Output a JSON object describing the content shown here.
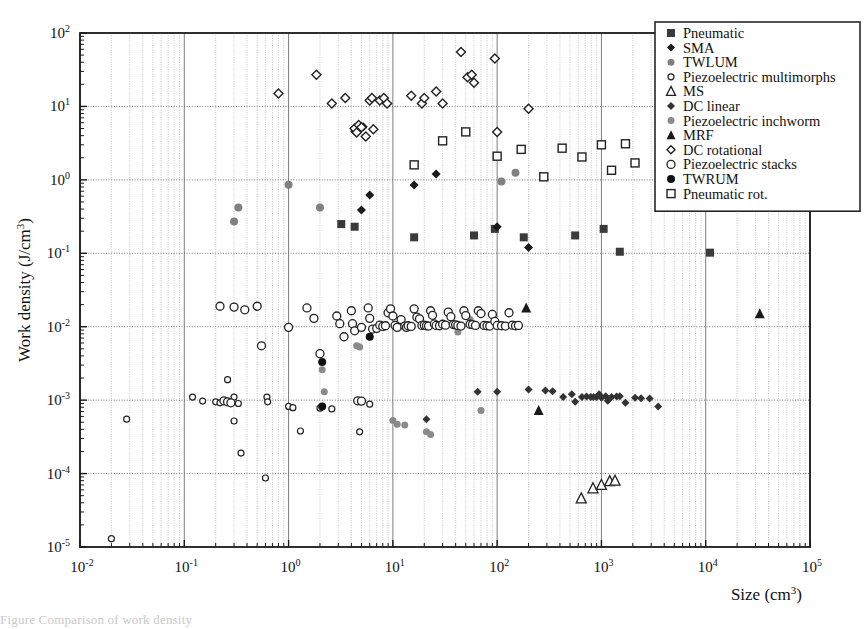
{
  "chart_data": {
    "type": "scatter",
    "title": "",
    "xlabel": "Size (cm3)",
    "xlabel_base": "Size (cm",
    "xlabel_exp": "3",
    "xlabel_close": ")",
    "ylabel": "Work density (J/cm3)",
    "ylabel_base": "Work density (J/cm",
    "ylabel_exp": "3",
    "ylabel_close": ")",
    "xscale": "log",
    "yscale": "log",
    "xlim": [
      0.01,
      100000
    ],
    "ylim": [
      1e-05,
      100
    ],
    "grid": true,
    "grid_minor": true,
    "legend_position": "top-right",
    "x_ticks": [
      {
        "value": 0.01,
        "label": "10",
        "exp": "-2"
      },
      {
        "value": 0.1,
        "label": "10",
        "exp": "-1"
      },
      {
        "value": 1,
        "label": "10",
        "exp": "0"
      },
      {
        "value": 10,
        "label": "10",
        "exp": "1"
      },
      {
        "value": 100,
        "label": "10",
        "exp": "2"
      },
      {
        "value": 1000,
        "label": "10",
        "exp": "3"
      },
      {
        "value": 10000,
        "label": "10",
        "exp": "4"
      },
      {
        "value": 100000,
        "label": "10",
        "exp": "5"
      }
    ],
    "y_ticks": [
      {
        "value": 1e-05,
        "label": "10",
        "exp": "-5"
      },
      {
        "value": 0.0001,
        "label": "10",
        "exp": "-4"
      },
      {
        "value": 0.001,
        "label": "10",
        "exp": "-3"
      },
      {
        "value": 0.01,
        "label": "10",
        "exp": "-2"
      },
      {
        "value": 0.1,
        "label": "10",
        "exp": "-1"
      },
      {
        "value": 1,
        "label": "10",
        "exp": "0"
      },
      {
        "value": 10,
        "label": "10",
        "exp": "1"
      },
      {
        "value": 100,
        "label": "10",
        "exp": "2"
      }
    ],
    "series": [
      {
        "name": "Pneumatic",
        "marker": "filled-square",
        "color": "#3a3a3a",
        "size": 8,
        "points": [
          [
            3.2,
            0.25
          ],
          [
            4.3,
            0.23
          ],
          [
            16,
            0.165
          ],
          [
            60,
            0.175
          ],
          [
            95,
            0.215
          ],
          [
            180,
            0.165
          ],
          [
            560,
            0.175
          ],
          [
            1050,
            0.215
          ],
          [
            1500,
            0.105
          ],
          [
            11000,
            0.102
          ]
        ]
      },
      {
        "name": "SMA",
        "marker": "filled-diamond",
        "color": "#1a1a1a",
        "size": 9,
        "points": [
          [
            4.3,
            4.6
          ],
          [
            5.2,
            5.3
          ],
          [
            6.0,
            0.62
          ],
          [
            5.0,
            0.39
          ],
          [
            16,
            0.85
          ],
          [
            26,
            1.2
          ],
          [
            100,
            0.23
          ],
          [
            200,
            0.12
          ]
        ]
      },
      {
        "name": "TWLUM",
        "marker": "filled-circle-gray",
        "color": "#808080",
        "size": 8,
        "points": [
          [
            0.3,
            0.27
          ],
          [
            0.33,
            0.42
          ],
          [
            1.0,
            0.86
          ],
          [
            2.0,
            0.42
          ],
          [
            110,
            0.95
          ],
          [
            150,
            1.25
          ]
        ]
      },
      {
        "name": "Piezoelectric multimorphs",
        "marker": "open-circle-small",
        "color": "#222222",
        "size": 6,
        "points": [
          [
            0.02,
            1.3e-05
          ],
          [
            0.028,
            0.00055
          ],
          [
            0.12,
            0.0011
          ],
          [
            0.15,
            0.00097
          ],
          [
            0.2,
            0.00095
          ],
          [
            0.22,
            0.00092
          ],
          [
            0.26,
            0.0019
          ],
          [
            0.3,
            0.00052
          ],
          [
            0.3,
            0.0011
          ],
          [
            0.33,
            0.0009
          ],
          [
            0.35,
            0.00019
          ],
          [
            0.62,
            0.0011
          ],
          [
            0.63,
            0.00095
          ],
          [
            0.6,
            8.7e-05
          ],
          [
            1.0,
            0.00082
          ],
          [
            1.1,
            0.00079
          ],
          [
            1.3,
            0.00038
          ],
          [
            2.0,
            0.00078
          ],
          [
            2.6,
            0.00076
          ],
          [
            4.8,
            0.00037
          ],
          [
            6.0,
            0.00088
          ]
        ]
      },
      {
        "name": "MS",
        "marker": "open-triangle",
        "color": "#222222",
        "size": 9,
        "points": [
          [
            640,
            4.6e-05
          ],
          [
            830,
            6.3e-05
          ],
          [
            1000,
            7e-05
          ],
          [
            1200,
            7.9e-05
          ],
          [
            1350,
            8e-05
          ]
        ]
      },
      {
        "name": "DC linear",
        "marker": "filled-diamond",
        "color": "#333333",
        "size": 8,
        "points": [
          [
            21,
            0.00055
          ],
          [
            65,
            0.0013
          ],
          [
            100,
            0.0013
          ],
          [
            200,
            0.0014
          ],
          [
            290,
            0.00135
          ],
          [
            340,
            0.00132
          ],
          [
            430,
            0.0011
          ],
          [
            520,
            0.0012
          ],
          [
            560,
            0.00095
          ],
          [
            650,
            0.0011
          ],
          [
            720,
            0.00112
          ],
          [
            790,
            0.0011
          ],
          [
            840,
            0.0011
          ],
          [
            900,
            0.0011
          ],
          [
            950,
            0.0012
          ],
          [
            1000,
            0.00108
          ],
          [
            1100,
            0.00113
          ],
          [
            1150,
            0.00098
          ],
          [
            1250,
            0.0011
          ],
          [
            1400,
            0.00112
          ],
          [
            1500,
            0.00113
          ],
          [
            1700,
            0.00092
          ],
          [
            2100,
            0.00108
          ],
          [
            2400,
            0.00106
          ],
          [
            2900,
            0.00105
          ],
          [
            3500,
            0.00082
          ]
        ]
      },
      {
        "name": "Piezoelectric inchworm",
        "marker": "filled-circle-gray",
        "color": "#8a8a8a",
        "size": 7,
        "points": [
          [
            2.1,
            0.0026
          ],
          [
            2.2,
            0.0013
          ],
          [
            4.5,
            0.0055
          ],
          [
            4.8,
            0.0053
          ],
          [
            10,
            0.00053
          ],
          [
            11,
            0.00047
          ],
          [
            13,
            0.00046
          ],
          [
            21,
            0.00037
          ],
          [
            23,
            0.00034
          ],
          [
            42,
            0.0085
          ],
          [
            55,
            0.0125
          ],
          [
            70,
            0.00072
          ]
        ]
      },
      {
        "name": "MRF",
        "marker": "filled-triangle",
        "color": "#1a1a1a",
        "size": 9,
        "points": [
          [
            190,
            0.018
          ],
          [
            250,
            0.00072
          ],
          [
            33000,
            0.015
          ]
        ]
      },
      {
        "name": "DC rotational",
        "marker": "open-diamond",
        "color": "#222222",
        "size": 9,
        "points": [
          [
            0.8,
            15
          ],
          [
            1.85,
            27
          ],
          [
            2.6,
            11
          ],
          [
            3.5,
            13
          ],
          [
            4.3,
            5.0
          ],
          [
            4.5,
            4.4
          ],
          [
            4.7,
            5.6
          ],
          [
            5.0,
            5.2
          ],
          [
            5.5,
            3.9
          ],
          [
            6.0,
            12
          ],
          [
            6.3,
            13
          ],
          [
            6.5,
            4.9
          ],
          [
            7.5,
            12
          ],
          [
            8.2,
            13
          ],
          [
            8.8,
            11
          ],
          [
            15,
            14
          ],
          [
            19,
            11
          ],
          [
            20,
            13
          ],
          [
            26,
            16
          ],
          [
            30,
            11
          ],
          [
            45,
            55
          ],
          [
            52,
            25
          ],
          [
            57,
            27
          ],
          [
            60,
            21
          ],
          [
            95,
            45
          ],
          [
            100,
            4.5
          ],
          [
            200,
            9.3
          ]
        ]
      },
      {
        "name": "Piezoelectric stacks",
        "marker": "open-circle",
        "color": "#222222",
        "size": 8,
        "points": [
          [
            0.22,
            0.019
          ],
          [
            0.3,
            0.0185
          ],
          [
            0.38,
            0.017
          ],
          [
            0.5,
            0.019
          ],
          [
            0.55,
            0.0055
          ],
          [
            1.0,
            0.0098
          ],
          [
            1.5,
            0.018
          ],
          [
            1.75,
            0.013
          ],
          [
            2.0,
            0.0043
          ],
          [
            2.9,
            0.014
          ],
          [
            3.1,
            0.011
          ],
          [
            3.4,
            0.0073
          ],
          [
            4.0,
            0.0165
          ],
          [
            4.1,
            0.011
          ],
          [
            4.3,
            0.0088
          ],
          [
            5.0,
            0.0098
          ],
          [
            5.8,
            0.018
          ],
          [
            6.0,
            0.013
          ],
          [
            6.4,
            0.0093
          ],
          [
            7.0,
            0.0095
          ],
          [
            7.5,
            0.0105
          ],
          [
            8.0,
            0.0101
          ],
          [
            8.5,
            0.0103
          ],
          [
            9.0,
            0.0155
          ],
          [
            9.5,
            0.0175
          ],
          [
            10,
            0.014
          ],
          [
            10.5,
            0.0104
          ],
          [
            11,
            0.0098
          ],
          [
            12,
            0.0125
          ],
          [
            13,
            0.0102
          ],
          [
            13.5,
            0.0098
          ],
          [
            14,
            0.0103
          ],
          [
            15,
            0.0101
          ],
          [
            16,
            0.0175
          ],
          [
            17,
            0.0135
          ],
          [
            18,
            0.0128
          ],
          [
            19,
            0.0104
          ],
          [
            20,
            0.0105
          ],
          [
            21,
            0.0103
          ],
          [
            22,
            0.0102
          ],
          [
            23,
            0.0165
          ],
          [
            24,
            0.0143
          ],
          [
            25,
            0.0109
          ],
          [
            26,
            0.0104
          ],
          [
            28,
            0.0103
          ],
          [
            30,
            0.0108
          ],
          [
            32,
            0.0105
          ],
          [
            34,
            0.0158
          ],
          [
            36,
            0.0137
          ],
          [
            38,
            0.0107
          ],
          [
            40,
            0.0106
          ],
          [
            42,
            0.0104
          ],
          [
            45,
            0.0102
          ],
          [
            48,
            0.0165
          ],
          [
            50,
            0.0142
          ],
          [
            55,
            0.0108
          ],
          [
            58,
            0.0107
          ],
          [
            62,
            0.0104
          ],
          [
            66,
            0.0165
          ],
          [
            70,
            0.0151
          ],
          [
            75,
            0.0104
          ],
          [
            80,
            0.0103
          ],
          [
            85,
            0.0102
          ],
          [
            90,
            0.0147
          ],
          [
            95,
            0.0118
          ],
          [
            100,
            0.0104
          ],
          [
            110,
            0.0103
          ],
          [
            120,
            0.0102
          ],
          [
            130,
            0.0155
          ],
          [
            140,
            0.0105
          ],
          [
            150,
            0.0103
          ],
          [
            160,
            0.0104
          ],
          [
            0.24,
            0.00098
          ],
          [
            0.26,
            0.00095
          ],
          [
            0.28,
            0.00092
          ],
          [
            4.6,
            0.00098
          ],
          [
            5.0,
            0.00097
          ]
        ]
      },
      {
        "name": "TWRUM",
        "marker": "filled-circle",
        "color": "#101010",
        "size": 8,
        "points": [
          [
            2.1,
            0.0033
          ],
          [
            2.1,
            0.00082
          ],
          [
            6.0,
            0.0073
          ]
        ]
      },
      {
        "name": "Pneumatic rot.",
        "marker": "open-square",
        "color": "#222222",
        "size": 8,
        "points": [
          [
            16,
            1.6
          ],
          [
            30,
            3.4
          ],
          [
            50,
            4.5
          ],
          [
            100,
            2.1
          ],
          [
            170,
            2.6
          ],
          [
            280,
            1.1
          ],
          [
            420,
            2.7
          ],
          [
            650,
            2.05
          ],
          [
            1000,
            3.0
          ],
          [
            1250,
            1.35
          ],
          [
            1700,
            3.1
          ],
          [
            2100,
            1.7
          ]
        ]
      }
    ]
  },
  "legend": {
    "items": [
      {
        "label": "Pneumatic",
        "marker": "filled-square",
        "color": "#3a3a3a"
      },
      {
        "label": "SMA",
        "marker": "filled-diamond",
        "color": "#1a1a1a"
      },
      {
        "label": "TWLUM",
        "marker": "filled-circle-gray",
        "color": "#808080"
      },
      {
        "label": "Piezoelectric multimorphs",
        "marker": "open-circle-small",
        "color": "#222222"
      },
      {
        "label": "MS",
        "marker": "open-triangle",
        "color": "#222222"
      },
      {
        "label": "DC linear",
        "marker": "filled-diamond",
        "color": "#333333"
      },
      {
        "label": "Piezoelectric inchworm",
        "marker": "filled-circle-gray",
        "color": "#8a8a8a"
      },
      {
        "label": "MRF",
        "marker": "filled-triangle",
        "color": "#1a1a1a"
      },
      {
        "label": "DC rotational",
        "marker": "open-diamond",
        "color": "#222222"
      },
      {
        "label": "Piezoelectric stacks",
        "marker": "open-circle",
        "color": "#222222"
      },
      {
        "label": "TWRUM",
        "marker": "filled-circle",
        "color": "#101010"
      },
      {
        "label": "Pneumatic rot.",
        "marker": "open-square",
        "color": "#222222"
      }
    ]
  },
  "caption": {
    "text": "Figure  Comparison of work density"
  },
  "colors": {
    "axis": "#1a1a1a",
    "grid_major": "#6e6e6e",
    "grid_minor": "#b8b8b8",
    "background": "#ffffff"
  }
}
